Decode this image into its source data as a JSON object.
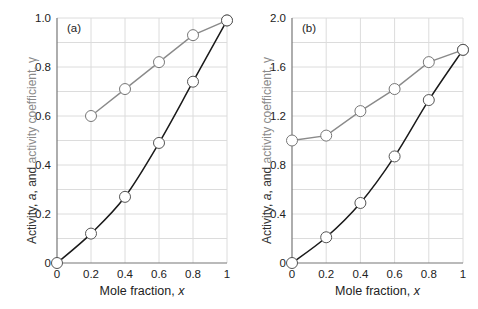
{
  "colors": {
    "activity": "#1a1a1a",
    "gamma": "#8a8a8a",
    "grid": "#dcdcdc",
    "axis": "#777777",
    "ylabel_gamma": "#8a8a8a",
    "ylabel_activity": "#333333"
  },
  "chart_data": [
    {
      "type": "line",
      "panel_label": "(a)",
      "title": "",
      "xlabel": "Mole fraction, x",
      "ylabel": "Activity, a, and activity coefficient, γ",
      "xlim": [
        0,
        1
      ],
      "ylim": [
        0,
        1.0
      ],
      "xticks": [
        0,
        0.2,
        0.4,
        0.6,
        0.8,
        1
      ],
      "xtick_labels": [
        "0",
        "0.2",
        "0.4",
        "0.6",
        "0.8",
        "1"
      ],
      "yticks": [
        0,
        0.2,
        0.4,
        0.6,
        0.8,
        1.0
      ],
      "ytick_labels": [
        "0",
        "0.2",
        "0.4",
        "0.6",
        "0.8",
        "1.0"
      ],
      "grid": true,
      "grid_y_step": 0.1,
      "series": [
        {
          "name": "Activity, a",
          "color": "#1a1a1a",
          "x": [
            0,
            0.2,
            0.4,
            0.6,
            0.8,
            1.0
          ],
          "y": [
            0,
            0.12,
            0.27,
            0.49,
            0.74,
            0.99
          ]
        },
        {
          "name": "Activity coefficient, γ",
          "color": "#8a8a8a",
          "x": [
            0.2,
            0.4,
            0.6,
            0.8,
            1.0
          ],
          "y": [
            0.6,
            0.71,
            0.82,
            0.93,
            0.99
          ]
        }
      ]
    },
    {
      "type": "line",
      "panel_label": "(b)",
      "title": "",
      "xlabel": "Mole fraction, x",
      "ylabel": "Activity, a, and activity coefficient, γ",
      "xlim": [
        0,
        1
      ],
      "ylim": [
        0,
        2.0
      ],
      "xticks": [
        0,
        0.2,
        0.4,
        0.6,
        0.8,
        1
      ],
      "xtick_labels": [
        "0",
        "0.2",
        "0.4",
        "0.6",
        "0.8",
        "1"
      ],
      "yticks": [
        0,
        0.4,
        0.8,
        1.2,
        1.6,
        2.0
      ],
      "ytick_labels": [
        "0",
        "0.4",
        "0.8",
        "1.2",
        "1.6",
        "2.0"
      ],
      "grid": true,
      "grid_y_step": 0.2,
      "series": [
        {
          "name": "Activity, a",
          "color": "#1a1a1a",
          "x": [
            0,
            0.2,
            0.4,
            0.6,
            0.8,
            1.0
          ],
          "y": [
            0,
            0.21,
            0.49,
            0.87,
            1.33,
            1.74
          ]
        },
        {
          "name": "Activity coefficient, γ",
          "color": "#8a8a8a",
          "x": [
            0,
            0.2,
            0.4,
            0.6,
            0.8,
            1.0
          ],
          "y": [
            1.0,
            1.04,
            1.24,
            1.42,
            1.64,
            1.74
          ]
        }
      ]
    }
  ],
  "labels": {
    "ylabel_activity_part": "Activity, ",
    "ylabel_a": "a",
    "ylabel_and": ", and ",
    "ylabel_gamma_part": "activity coefficient, γ",
    "xlabel_text": "Mole fraction, ",
    "xlabel_var": "x"
  }
}
